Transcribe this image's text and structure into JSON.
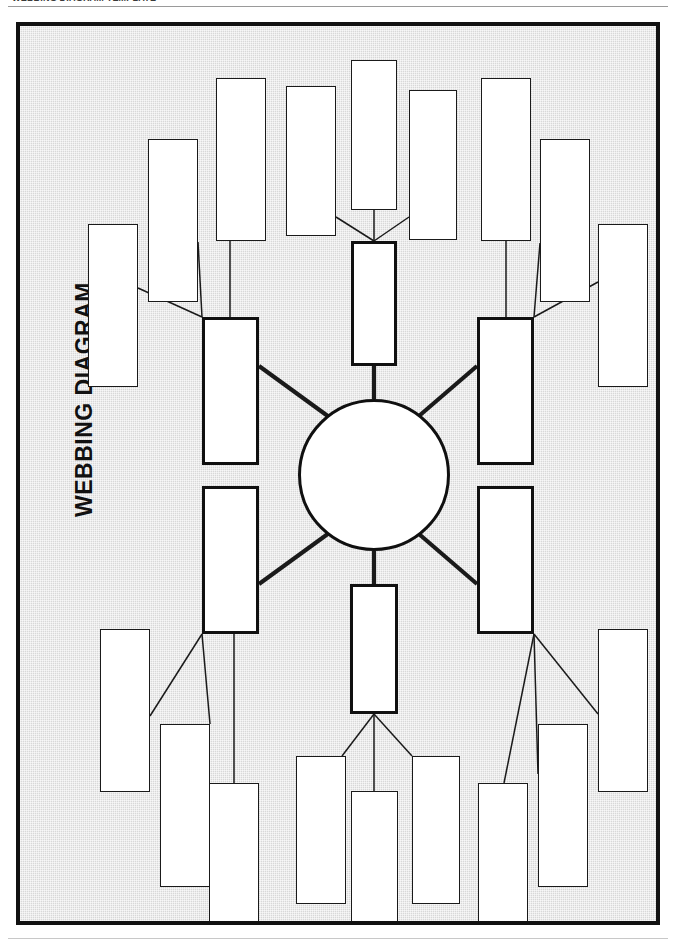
{
  "page": {
    "header_text": "WEBBING DIAGRAM TEMPLATE",
    "title": "WEBBING DIAGRAM",
    "background_color": "#d8d8d8",
    "frame_color": "#111111",
    "node_fill": "#ffffff",
    "node_border": "#1a1a1a",
    "branch_border": "#101010"
  },
  "diagram": {
    "type": "webbing-diagram",
    "center": {
      "label": "",
      "shape": "circle"
    },
    "branch_count": 6,
    "branches": [
      {
        "id": "branch-top-left",
        "label": "",
        "leaf_count": 3
      },
      {
        "id": "branch-top-center",
        "label": "",
        "leaf_count": 3
      },
      {
        "id": "branch-top-right",
        "label": "",
        "leaf_count": 3
      },
      {
        "id": "branch-bottom-left",
        "label": "",
        "leaf_count": 3
      },
      {
        "id": "branch-bottom-center",
        "label": "",
        "leaf_count": 3
      },
      {
        "id": "branch-bottom-right",
        "label": "",
        "leaf_count": 3
      }
    ],
    "nodes": {
      "center": {
        "cx": 369,
        "cy": 449,
        "r": 76
      },
      "branch_tl": {
        "x": 182,
        "y": 291,
        "w": 57,
        "h": 148
      },
      "branch_tc": {
        "x": 332,
        "y": 215,
        "w": 46,
        "h": 125
      },
      "branch_tr": {
        "x": 457,
        "y": 291,
        "w": 57,
        "h": 148
      },
      "branch_bl": {
        "x": 182,
        "y": 460,
        "w": 57,
        "h": 148
      },
      "branch_bc": {
        "x": 330,
        "y": 558,
        "w": 48,
        "h": 130
      },
      "branch_br": {
        "x": 457,
        "y": 460,
        "w": 57,
        "h": 148
      },
      "leaf_tl_1": {
        "x": 68,
        "y": 198,
        "w": 50,
        "h": 163
      },
      "leaf_tl_2": {
        "x": 128,
        "y": 113,
        "w": 50,
        "h": 163
      },
      "leaf_tl_3": {
        "x": 196,
        "y": 52,
        "w": 50,
        "h": 163
      },
      "leaf_tc_1": {
        "x": 266,
        "y": 60,
        "w": 50,
        "h": 150
      },
      "leaf_tc_2": {
        "x": 331,
        "y": 34,
        "w": 46,
        "h": 150
      },
      "leaf_tc_3": {
        "x": 389,
        "y": 64,
        "w": 48,
        "h": 150
      },
      "leaf_tr_1": {
        "x": 457,
        "y": 52,
        "w": 50,
        "h": 163
      },
      "leaf_tr_2": {
        "x": 520,
        "y": 113,
        "w": 50,
        "h": 163
      },
      "leaf_tr_3": {
        "x": 578,
        "y": 198,
        "w": 50,
        "h": 163
      },
      "leaf_bl_1": {
        "x": 80,
        "y": 603,
        "w": 50,
        "h": 163
      },
      "leaf_bl_2": {
        "x": 140,
        "y": 698,
        "w": 50,
        "h": 163
      },
      "leaf_bl_3": {
        "x": 200,
        "y": 757,
        "w": 50,
        "h": 163
      },
      "leaf_bc_1": {
        "x": 276,
        "y": 730,
        "w": 50,
        "h": 148
      },
      "leaf_bc_2": {
        "x": 335,
        "y": 765,
        "w": 47,
        "h": 155
      },
      "leaf_bc_3": {
        "x": 392,
        "y": 730,
        "w": 48,
        "h": 148
      },
      "leaf_br_1": {
        "x": 458,
        "y": 757,
        "w": 50,
        "h": 163
      },
      "leaf_br_2": {
        "x": 518,
        "y": 698,
        "w": 50,
        "h": 163
      },
      "leaf_br_3": {
        "x": 578,
        "y": 603,
        "w": 50,
        "h": 163
      }
    }
  }
}
